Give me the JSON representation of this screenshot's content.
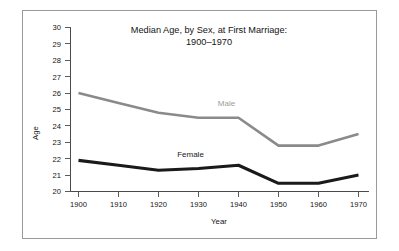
{
  "chart_data": {
    "type": "line",
    "title": "Median Age, by Sex, at First Marriage:",
    "subtitle": "1900–1970",
    "xlabel": "Year",
    "ylabel": "Age",
    "x": [
      1900,
      1910,
      1920,
      1930,
      1940,
      1950,
      1960,
      1970
    ],
    "xticklabels": [
      "1900",
      "1910",
      "1920",
      "1930",
      "1940",
      "1950",
      "1960",
      "1970"
    ],
    "yticklabels": [
      "20",
      "21",
      "22",
      "23",
      "24",
      "25",
      "26",
      "27",
      "28",
      "29",
      "30"
    ],
    "yticks": [
      20,
      21,
      22,
      23,
      24,
      25,
      26,
      27,
      28,
      29,
      30
    ],
    "xlim": [
      1898,
      1972
    ],
    "ylim": [
      20,
      30
    ],
    "grid": false,
    "legend": "inline-series-labels",
    "series": [
      {
        "name": "Male",
        "color": "#8a8a8a",
        "values": [
          26.0,
          25.4,
          24.8,
          24.5,
          24.5,
          22.8,
          22.8,
          23.5
        ],
        "label_x": 1937,
        "label_y": 25.2
      },
      {
        "name": "Female",
        "color": "#1a1a1a",
        "values": [
          21.9,
          21.6,
          21.3,
          21.4,
          21.6,
          20.5,
          20.5,
          21.0
        ],
        "label_x": 1928,
        "label_y": 22.1
      }
    ]
  }
}
